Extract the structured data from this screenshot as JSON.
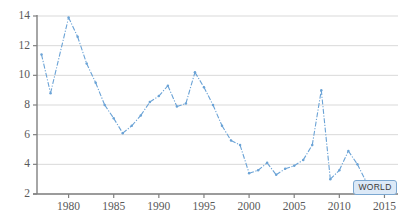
{
  "chart_data": {
    "type": "line",
    "title": "",
    "xlabel": "",
    "ylabel": "",
    "xlim": [
      1976.5,
      2016.5
    ],
    "ylim": [
      2,
      14
    ],
    "grid": true,
    "legend_position": "inline-end-label",
    "y_ticks": [
      2,
      4,
      6,
      8,
      10,
      12,
      14
    ],
    "x_ticks": [
      1980,
      1985,
      1990,
      1995,
      2000,
      2005,
      2010,
      2015
    ],
    "series": [
      {
        "name": "WORLD",
        "color": "#6ba3d6",
        "line_style": "dash-dot",
        "marker": "small-dot",
        "x": [
          1977,
          1978,
          1980,
          1981,
          1982,
          1983,
          1984,
          1985,
          1986,
          1987,
          1988,
          1989,
          1990,
          1991,
          1992,
          1993,
          1994,
          1995,
          1996,
          1997,
          1998,
          1999,
          2000,
          2001,
          2002,
          2003,
          2004,
          2005,
          2006,
          2007,
          2008,
          2009,
          2010,
          2011,
          2012,
          2013,
          2014,
          2015
        ],
        "values": [
          11.4,
          8.8,
          13.9,
          12.6,
          10.8,
          9.5,
          8.0,
          7.1,
          6.1,
          6.6,
          7.3,
          8.2,
          8.6,
          9.3,
          7.9,
          8.1,
          10.2,
          9.2,
          8.0,
          6.6,
          5.6,
          5.3,
          3.4,
          3.6,
          4.1,
          3.3,
          3.7,
          3.9,
          4.3,
          5.3,
          9.0,
          3.0,
          3.6,
          4.9,
          4.0,
          2.8,
          2.3,
          2.2
        ]
      }
    ],
    "annotations": [
      {
        "name": "series-end-label",
        "text": "WORLD",
        "x": 2014,
        "y": 2.45
      }
    ]
  },
  "style": {
    "grid_color": "#d9d9d9",
    "axis_color": "#808080",
    "tick_text_color": "#595959",
    "plot_background": "#ffffff",
    "tooltip_fill": "#dce9f7",
    "tooltip_border": "#7ba7d0"
  }
}
